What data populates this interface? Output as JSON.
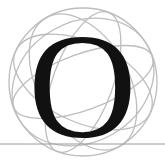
{
  "dropcap": {
    "letter": "O",
    "letter_color": "#111111",
    "ornament": "wireframe-globe",
    "ornament_color": "#bdbdbd",
    "rule_color": "#9a9a9a"
  }
}
